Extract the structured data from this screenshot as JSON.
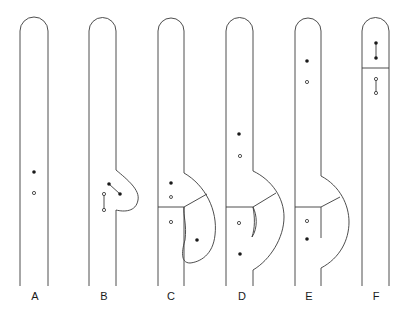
{
  "figure": {
    "type": "diagram",
    "panels": [
      {
        "label": "A",
        "dots": [
          "filled",
          "open"
        ]
      },
      {
        "label": "B",
        "dots": [
          "filled-pair-connected",
          "open-pair-connected"
        ]
      },
      {
        "label": "C",
        "dots": [
          "filled",
          "open",
          "open",
          "filled"
        ]
      },
      {
        "label": "D",
        "dots": [
          "filled",
          "open",
          "open",
          "filled"
        ]
      },
      {
        "label": "E",
        "dots": [
          "filled",
          "open",
          "open",
          "filled"
        ]
      },
      {
        "label": "F",
        "dots": [
          "filled-pair-connected",
          "open-pair-connected"
        ]
      }
    ]
  },
  "labels": {
    "a": "A",
    "b": "B",
    "c": "C",
    "d": "D",
    "e": "E",
    "f": "F"
  },
  "colors": {
    "line": "#3a3a3a",
    "dot": "#1a1a1a",
    "background": "#ffffff"
  }
}
